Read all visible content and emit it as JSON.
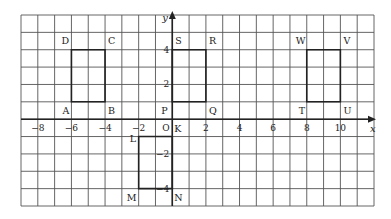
{
  "diagram": {
    "type": "coordinate-grid",
    "grid": {
      "x_min": -9,
      "x_max": 12,
      "y_min": -5,
      "y_max": 6,
      "left_px": 21,
      "right_px": 374,
      "top_px": 15,
      "bottom_px": 206,
      "line_color": "#555555",
      "line_width": 0.9
    },
    "axes": {
      "x_label": "x",
      "y_label": "y",
      "color": "#222222",
      "x_ticks": [
        {
          "value": -8,
          "label": "−8"
        },
        {
          "value": -6,
          "label": "−6"
        },
        {
          "value": -4,
          "label": "−4"
        },
        {
          "value": -2,
          "label": "−2"
        },
        {
          "value": 2,
          "label": "2"
        },
        {
          "value": 4,
          "label": "4"
        },
        {
          "value": 6,
          "label": "6"
        },
        {
          "value": 8,
          "label": "8"
        },
        {
          "value": 10,
          "label": "10"
        }
      ],
      "y_ticks": [
        {
          "value": 4,
          "label": "4"
        },
        {
          "value": 2,
          "label": "2"
        },
        {
          "value": -2,
          "label": "−2"
        },
        {
          "value": -4,
          "label": "−4"
        }
      ],
      "origin_label": "O"
    },
    "shapes": [
      {
        "name": "ABCD",
        "points": [
          [
            -6,
            1
          ],
          [
            -4,
            1
          ],
          [
            -4,
            4
          ],
          [
            -6,
            4
          ]
        ]
      },
      {
        "name": "PQRS",
        "points": [
          [
            0,
            1
          ],
          [
            2,
            1
          ],
          [
            2,
            4
          ],
          [
            0,
            4
          ]
        ]
      },
      {
        "name": "TUVW",
        "points": [
          [
            8,
            1
          ],
          [
            10,
            1
          ],
          [
            10,
            4
          ],
          [
            8,
            4
          ]
        ]
      },
      {
        "name": "KLMN",
        "points": [
          [
            0,
            -1
          ],
          [
            -2,
            -1
          ],
          [
            -2,
            -4
          ],
          [
            0,
            -4
          ]
        ]
      }
    ],
    "point_labels": [
      {
        "text": "A",
        "x": -6,
        "y": 1,
        "dx": -9,
        "dy": 12
      },
      {
        "text": "B",
        "x": -4,
        "y": 1,
        "dx": 3,
        "dy": 12
      },
      {
        "text": "C",
        "x": -4,
        "y": 4,
        "dx": 3,
        "dy": -6
      },
      {
        "text": "D",
        "x": -6,
        "y": 4,
        "dx": -10,
        "dy": -6
      },
      {
        "text": "P",
        "x": 0,
        "y": 1,
        "dx": -11,
        "dy": 12
      },
      {
        "text": "Q",
        "x": 2,
        "y": 1,
        "dx": 3,
        "dy": 12
      },
      {
        "text": "R",
        "x": 2,
        "y": 4,
        "dx": 3,
        "dy": -6
      },
      {
        "text": "S",
        "x": 0,
        "y": 4,
        "dx": 3,
        "dy": -6
      },
      {
        "text": "T",
        "x": 8,
        "y": 1,
        "dx": -8,
        "dy": 12
      },
      {
        "text": "U",
        "x": 10,
        "y": 1,
        "dx": 3,
        "dy": 12
      },
      {
        "text": "V",
        "x": 10,
        "y": 4,
        "dx": 3,
        "dy": -6
      },
      {
        "text": "W",
        "x": 8,
        "y": 4,
        "dx": -11,
        "dy": -6
      },
      {
        "text": "K",
        "x": 0,
        "y": 0,
        "dx": 2,
        "dy": 13
      },
      {
        "text": "L",
        "x": -2,
        "y": -1,
        "dx": -9,
        "dy": 5
      },
      {
        "text": "M",
        "x": -2,
        "y": -4,
        "dx": -12,
        "dy": 12
      },
      {
        "text": "N",
        "x": 0,
        "y": -4,
        "dx": 2,
        "dy": 12
      }
    ]
  }
}
